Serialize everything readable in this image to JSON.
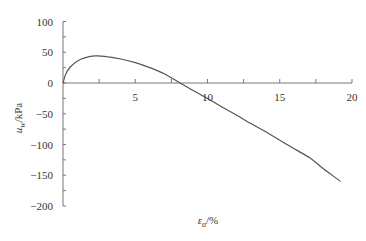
{
  "chart_data": {
    "type": "line",
    "title": "",
    "xlabel": "εa/%",
    "ylabel": "uw/kPa",
    "xlabel_parts": {
      "symbol": "ε",
      "sub": "a",
      "unit": "/%"
    },
    "ylabel_parts": {
      "symbol": "u",
      "sub": "w",
      "unit": "/kPa"
    },
    "xlim": [
      0,
      20
    ],
    "ylim": [
      -200,
      100
    ],
    "x_ticks": [
      0,
      5,
      10,
      15,
      20
    ],
    "x_tick_labels": [
      "",
      "5",
      "10",
      "15",
      "20"
    ],
    "x_minor_ticks": [
      2.5,
      7.5,
      12.5,
      17.5
    ],
    "y_ticks": [
      100,
      50,
      0,
      -50,
      -100,
      -150,
      -200
    ],
    "y_tick_labels": [
      "100",
      "50",
      "0",
      "-50",
      "-100",
      "-150",
      "-200"
    ],
    "y_minor_ticks": [
      75,
      25,
      -25,
      -75,
      -125,
      -175
    ],
    "grid": false,
    "legend": null,
    "series": [
      {
        "name": "uw",
        "color": "#555555",
        "x": [
          0,
          0.2,
          0.5,
          1.0,
          1.5,
          2.2,
          3.0,
          4.0,
          5.0,
          6.0,
          7.0,
          8.1,
          9.0,
          10.0,
          11.0,
          12.0,
          13.0,
          14.0,
          15.0,
          16.0,
          17.1,
          18.0,
          19.2
        ],
        "y": [
          0,
          15,
          26,
          36,
          41,
          44,
          43,
          39,
          33,
          25,
          15,
          0,
          -12,
          -25,
          -39,
          -52,
          -66,
          -79,
          -93,
          -107,
          -122,
          -139,
          -160
        ]
      }
    ]
  },
  "colors": {
    "axis": "#777777",
    "line": "#555555",
    "text": "#333333",
    "background": "#ffffff"
  }
}
